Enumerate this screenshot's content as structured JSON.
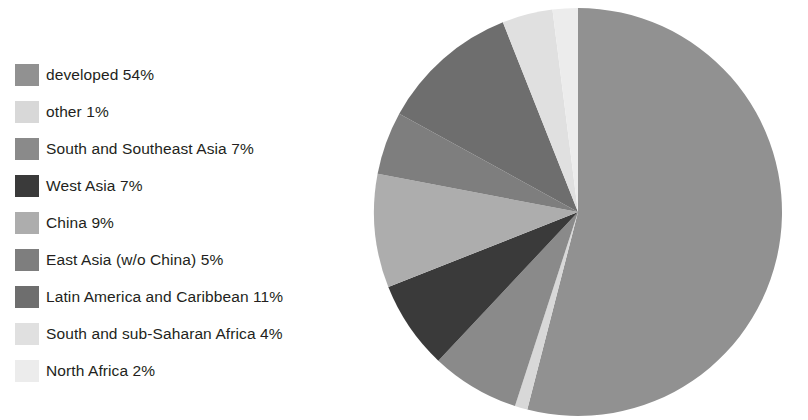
{
  "chart_data": {
    "type": "pie",
    "title": "",
    "legend_position": "left",
    "start_angle_deg": 0,
    "direction": "clockwise",
    "units": "percent",
    "categories": [
      "developed",
      "other",
      "South and Southeast Asia",
      "West Asia",
      "China",
      "East Asia (w/o China)",
      "Latin America and Caribbean",
      "South and sub-Saharan Africa",
      "North Africa"
    ],
    "values": [
      54,
      1,
      7,
      7,
      9,
      5,
      11,
      4,
      2
    ],
    "colors": [
      "#919191",
      "#d8d8d8",
      "#8a8a8a",
      "#3a3a3a",
      "#adadad",
      "#7e7e7e",
      "#6e6e6e",
      "#e0e0e0",
      "#ececec"
    ],
    "slices": [
      {
        "label": "developed",
        "value": 54,
        "display": "developed 54%",
        "color": "#919191"
      },
      {
        "label": "other",
        "value": 1,
        "display": "other 1%",
        "color": "#d8d8d8"
      },
      {
        "label": "South and Southeast Asia",
        "value": 7,
        "display": "South and Southeast Asia 7%",
        "color": "#8a8a8a"
      },
      {
        "label": "West Asia",
        "value": 7,
        "display": "West Asia 7%",
        "color": "#3a3a3a"
      },
      {
        "label": "China",
        "value": 9,
        "display": "China 9%",
        "color": "#adadad"
      },
      {
        "label": "East Asia (w/o China)",
        "value": 5,
        "display": "East Asia (w/o China) 5%",
        "color": "#7e7e7e"
      },
      {
        "label": "Latin America and Caribbean",
        "value": 11,
        "display": "Latin America and Caribbean 11%",
        "color": "#6e6e6e"
      },
      {
        "label": "South and sub-Saharan Africa",
        "value": 4,
        "display": "South and sub-Saharan Africa 4%",
        "color": "#e0e0e0"
      },
      {
        "label": "North Africa",
        "value": 2,
        "display": "North Africa 2%",
        "color": "#ececec"
      }
    ]
  },
  "legend": {
    "items": [
      {
        "label": "developed 54%",
        "color": "#919191"
      },
      {
        "label": "other 1%",
        "color": "#d8d8d8"
      },
      {
        "label": "South and Southeast Asia 7%",
        "color": "#8a8a8a"
      },
      {
        "label": "West Asia 7%",
        "color": "#3a3a3a"
      },
      {
        "label": "China 9%",
        "color": "#adadad"
      },
      {
        "label": "East Asia (w/o China) 5%",
        "color": "#7e7e7e"
      },
      {
        "label": "Latin America and Caribbean 11%",
        "color": "#6e6e6e"
      },
      {
        "label": "South and sub-Saharan Africa 4%",
        "color": "#e0e0e0"
      },
      {
        "label": "North Africa 2%",
        "color": "#ececec"
      }
    ]
  },
  "page": {
    "background": "#ffffff",
    "width": 808,
    "height": 420
  }
}
